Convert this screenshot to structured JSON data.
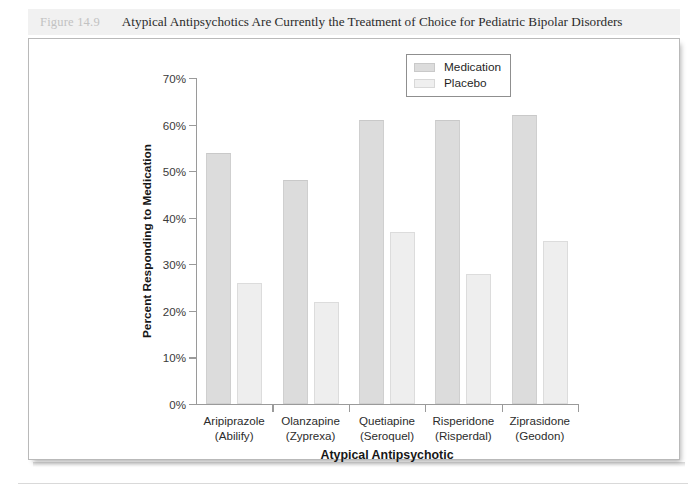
{
  "figure": {
    "number": "Figure 14.9",
    "title": "Atypical Antipsychotics Are Currently the Treatment of Choice for Pediatric Bipolar Disorders"
  },
  "legend": {
    "position": "top-right",
    "entries": [
      {
        "label": "Medication",
        "color": "#dcdcdc"
      },
      {
        "label": "Placebo",
        "color": "#efefef"
      }
    ]
  },
  "chart_data": {
    "type": "bar",
    "title": "Atypical Antipsychotics Are Currently the Treatment of Choice for Pediatric Bipolar Disorders",
    "xlabel": "Atypical Antipsychotic",
    "ylabel": "Percent Responding to Medication",
    "ylim": [
      0,
      70
    ],
    "ytick_labels": [
      "0%",
      "10%",
      "20%",
      "30%",
      "40%",
      "50%",
      "60%",
      "70%"
    ],
    "ytick_values": [
      0,
      10,
      20,
      30,
      40,
      50,
      60,
      70
    ],
    "grid": false,
    "categories": [
      "Aripiprazole\n(Abilify)",
      "Olanzapine\n(Zyprexa)",
      "Quetiapine\n(Seroquel)",
      "Risperidone\n(Risperdal)",
      "Ziprasidone\n(Geodon)"
    ],
    "category_lines": [
      [
        "Aripiprazole",
        "(Abilify)"
      ],
      [
        "Olanzapine",
        "(Zyprexa)"
      ],
      [
        "Quetiapine",
        "(Seroquel)"
      ],
      [
        "Risperidone",
        "(Risperdal)"
      ],
      [
        "Ziprasidone",
        "(Geodon)"
      ]
    ],
    "series": [
      {
        "name": "Medication",
        "color": "#dcdcdc",
        "values": [
          54,
          48,
          61,
          61,
          62
        ]
      },
      {
        "name": "Placebo",
        "color": "#efefef",
        "values": [
          26,
          22,
          37,
          28,
          35
        ]
      }
    ]
  }
}
